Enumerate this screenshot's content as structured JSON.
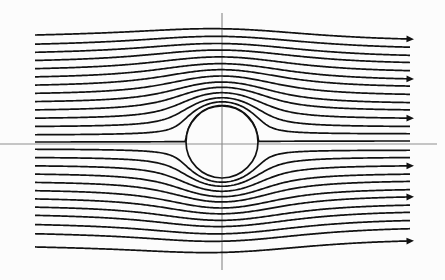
{
  "figure": {
    "width": 445,
    "height": 280,
    "background_color": "#fcfcfc"
  },
  "chart_data": {
    "type": "line",
    "subtitle": "Ideal inviscid uniform flow around a circle",
    "xlabel": "",
    "ylabel": "",
    "grid": false,
    "legend": null,
    "annotations": [],
    "xlim": [
      0,
      445
    ],
    "ylim": [
      0,
      280
    ],
    "obstacle": {
      "shape": "circle",
      "center_x": 222,
      "center_y": 142,
      "radius": 36,
      "stroke_color": "#111111",
      "fill_color": "#fcfcfc",
      "stroke_width": 1.7
    },
    "axes_overlay": {
      "horizontal_y": 144,
      "horizontal_x_start": 0,
      "horizontal_x_end": 437,
      "vertical_x": 222,
      "vertical_y_start": 13,
      "vertical_y_end": 270,
      "color": "#8d8d8d",
      "stroke_width": 1.15
    },
    "flow": {
      "direction": "left-to-right",
      "inlet_x": 35,
      "outlet_x": 410,
      "streamline_count": 26,
      "stroke_color": "#111111",
      "stroke_width": 1.7
    },
    "series": [
      {
        "name": "streamline-01",
        "inlet_y": 38,
        "outlet_y": 42,
        "arrow": true
      },
      {
        "name": "streamline-02",
        "inlet_y": 47,
        "outlet_y": 50,
        "arrow": false
      },
      {
        "name": "streamline-03",
        "inlet_y": 55,
        "outlet_y": 58,
        "arrow": false
      },
      {
        "name": "streamline-04",
        "inlet_y": 63,
        "outlet_y": 65,
        "arrow": false
      },
      {
        "name": "streamline-05",
        "inlet_y": 71,
        "outlet_y": 73,
        "arrow": false
      },
      {
        "name": "streamline-06",
        "inlet_y": 79,
        "outlet_y": 81,
        "arrow": true
      },
      {
        "name": "streamline-07",
        "inlet_y": 87,
        "outlet_y": 88,
        "arrow": false
      },
      {
        "name": "streamline-08",
        "inlet_y": 95,
        "outlet_y": 96,
        "arrow": false
      },
      {
        "name": "streamline-09",
        "inlet_y": 103,
        "outlet_y": 104,
        "arrow": false
      },
      {
        "name": "streamline-10",
        "inlet_y": 111,
        "outlet_y": 111,
        "arrow": false
      },
      {
        "name": "streamline-11",
        "inlet_y": 119,
        "outlet_y": 119,
        "arrow": true
      },
      {
        "name": "streamline-12",
        "inlet_y": 127,
        "outlet_y": 127,
        "arrow": false
      },
      {
        "name": "streamline-13",
        "inlet_y": 135,
        "outlet_y": 134,
        "arrow": false
      },
      {
        "name": "streamline-14",
        "inlet_y": 142,
        "outlet_y": 141,
        "arrow": false
      },
      {
        "name": "streamline-15",
        "inlet_y": 149,
        "outlet_y": 150,
        "arrow": false
      },
      {
        "name": "streamline-16",
        "inlet_y": 157,
        "outlet_y": 157,
        "arrow": false
      },
      {
        "name": "streamline-17",
        "inlet_y": 165,
        "outlet_y": 165,
        "arrow": true
      },
      {
        "name": "streamline-18",
        "inlet_y": 173,
        "outlet_y": 173,
        "arrow": false
      },
      {
        "name": "streamline-19",
        "inlet_y": 181,
        "outlet_y": 180,
        "arrow": false
      },
      {
        "name": "streamline-20",
        "inlet_y": 189,
        "outlet_y": 188,
        "arrow": false
      },
      {
        "name": "streamline-21",
        "inlet_y": 197,
        "outlet_y": 195,
        "arrow": true
      },
      {
        "name": "streamline-22",
        "inlet_y": 205,
        "outlet_y": 203,
        "arrow": false
      },
      {
        "name": "streamline-23",
        "inlet_y": 213,
        "outlet_y": 210,
        "arrow": false
      },
      {
        "name": "streamline-24",
        "inlet_y": 222,
        "outlet_y": 218,
        "arrow": false
      },
      {
        "name": "streamline-25",
        "inlet_y": 231,
        "outlet_y": 226,
        "arrow": false
      },
      {
        "name": "streamline-26",
        "inlet_y": 244,
        "outlet_y": 238,
        "arrow": true
      }
    ]
  }
}
